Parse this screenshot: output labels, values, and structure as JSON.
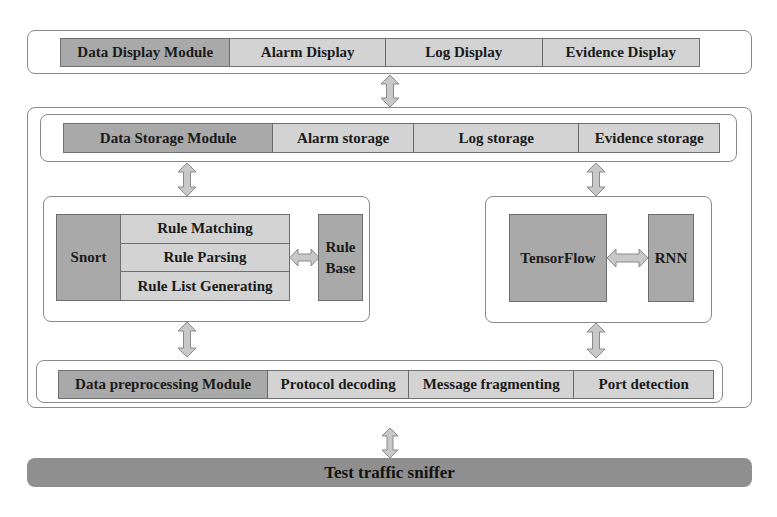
{
  "display_module": {
    "title": "Data Display Module",
    "items": [
      "Alarm Display",
      "Log Display",
      "Evidence Display"
    ]
  },
  "storage_module": {
    "title": "Data Storage Module",
    "items": [
      "Alarm storage",
      "Log storage",
      "Evidence storage"
    ]
  },
  "snort_engine": {
    "title": "Snort",
    "functions": [
      "Rule Matching",
      "Rule Parsing",
      "Rule List Generating"
    ],
    "rule_base": "Rule Base"
  },
  "ml_engine": {
    "framework": "TensorFlow",
    "model": "RNN"
  },
  "preprocessing_module": {
    "title": "Data preprocessing Module",
    "items": [
      "Protocol decoding",
      "Message fragmenting",
      "Port detection"
    ]
  },
  "sniffer": {
    "label": "Test traffic sniffer"
  },
  "colors": {
    "module_title_fill": "#a9a9a9",
    "item_fill": "#d3d3d3",
    "sniffer_fill": "#8f8f8f",
    "arrow_fill": "#c8c8c8",
    "border": "#8a8a8a"
  }
}
